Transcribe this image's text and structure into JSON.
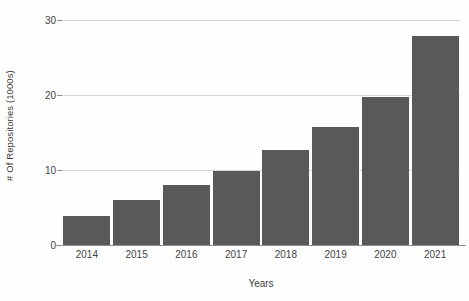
{
  "chart_data": {
    "type": "bar",
    "title": "",
    "subtitle": "",
    "xlabel": "Years",
    "ylabel": "# Of Repositories (1000s)",
    "categories": [
      "2014",
      "2015",
      "2016",
      "2017",
      "2018",
      "2019",
      "2020",
      "2021"
    ],
    "values": [
      3.9,
      6.0,
      8.0,
      9.9,
      12.7,
      15.7,
      19.8,
      27.9
    ],
    "series": [
      {
        "name": "# Of Repositories (1000s)",
        "values": [
          3.9,
          6.0,
          8.0,
          9.9,
          12.7,
          15.7,
          19.8,
          27.9
        ]
      }
    ],
    "ylim": [
      0,
      30
    ],
    "yticks": [
      0,
      10,
      20,
      30
    ],
    "ytick_labels": [
      "0",
      "10",
      "20",
      "30"
    ],
    "xtick_labels": [
      "2014",
      "2015",
      "2016",
      "2017",
      "2018",
      "2019",
      "2020",
      "2021"
    ],
    "grid": true,
    "grid_axis": "y",
    "legend": false,
    "legend_position": "none",
    "bar_color": "#595959",
    "gridline_color": "#d6d6d6",
    "axis_color": "#8d8d8d",
    "text_color": "#3c3c3c",
    "background_color": "#ffffff",
    "annotations": []
  }
}
